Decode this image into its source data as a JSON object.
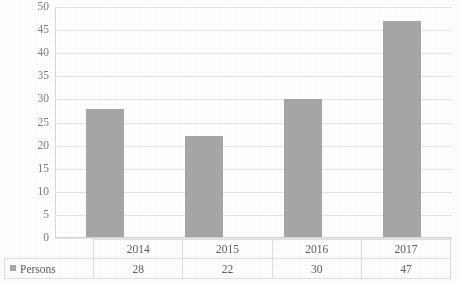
{
  "chart_data": {
    "type": "bar",
    "title": "",
    "xlabel": "",
    "ylabel": "",
    "categories": [
      "2014",
      "2015",
      "2016",
      "2017"
    ],
    "series": [
      {
        "name": "Persons",
        "values": [
          28,
          22,
          30,
          47
        ]
      }
    ],
    "ylim": [
      0,
      50
    ],
    "ytick_step": 5,
    "yticks": [
      "50",
      "45",
      "40",
      "35",
      "30",
      "25",
      "20",
      "15",
      "10",
      "5",
      "0"
    ],
    "grid": true,
    "grid_axis": "y",
    "legend_position": "bottom-left",
    "bar_color": "#a6a6a6",
    "grid_color": "#e3e3e3",
    "axis_text_color": "#7d7d7d"
  },
  "legend": {
    "marker": "square-marker-icon",
    "label": "Persons"
  },
  "table": {
    "header": [
      "",
      "2014",
      "2015",
      "2016",
      "2017"
    ],
    "row_label": "Persons",
    "values": [
      "28",
      "22",
      "30",
      "47"
    ]
  },
  "title_remnant": " "
}
